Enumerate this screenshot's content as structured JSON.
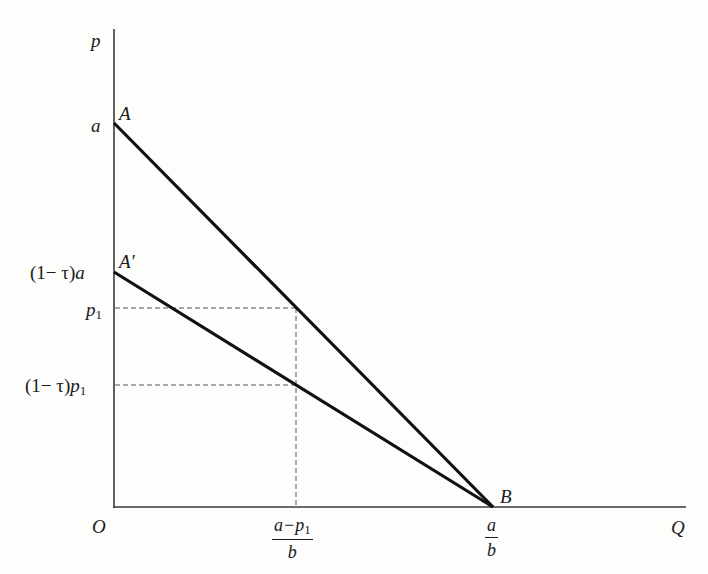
{
  "diagram": {
    "axes": {
      "y_label": "p",
      "x_label": "Q",
      "origin_label": "O"
    },
    "points": {
      "A": "A",
      "A_prime": "A′",
      "B": "B"
    },
    "y_ticks": {
      "a": "a",
      "one_minus_tau_a_prefix": "(1− τ)",
      "one_minus_tau_a_var": "a",
      "p1_var": "p",
      "p1_sub": "1",
      "one_minus_tau_p1_prefix": "(1− τ)",
      "one_minus_tau_p1_var": "p",
      "one_minus_tau_p1_sub": "1"
    },
    "x_ticks": {
      "q1_num_a": "a",
      "q1_num_minus": "−",
      "q1_num_p": "p",
      "q1_num_sub": "1",
      "q1_den": "b",
      "ab_num": "a",
      "ab_den": "b"
    },
    "lines": [
      {
        "name": "demand-AB",
        "from": "A (0, a)",
        "to": "B (a/b, 0)",
        "style": "solid-thick"
      },
      {
        "name": "net-demand-A'B",
        "from": "A′ (0, (1−τ)a)",
        "to": "B (a/b, 0)",
        "style": "solid-thick"
      },
      {
        "name": "p1-guide",
        "style": "dashed"
      },
      {
        "name": "(1−τ)p1-guide",
        "style": "dashed"
      },
      {
        "name": "(a−p1)/b-guide",
        "style": "dashed"
      }
    ]
  }
}
